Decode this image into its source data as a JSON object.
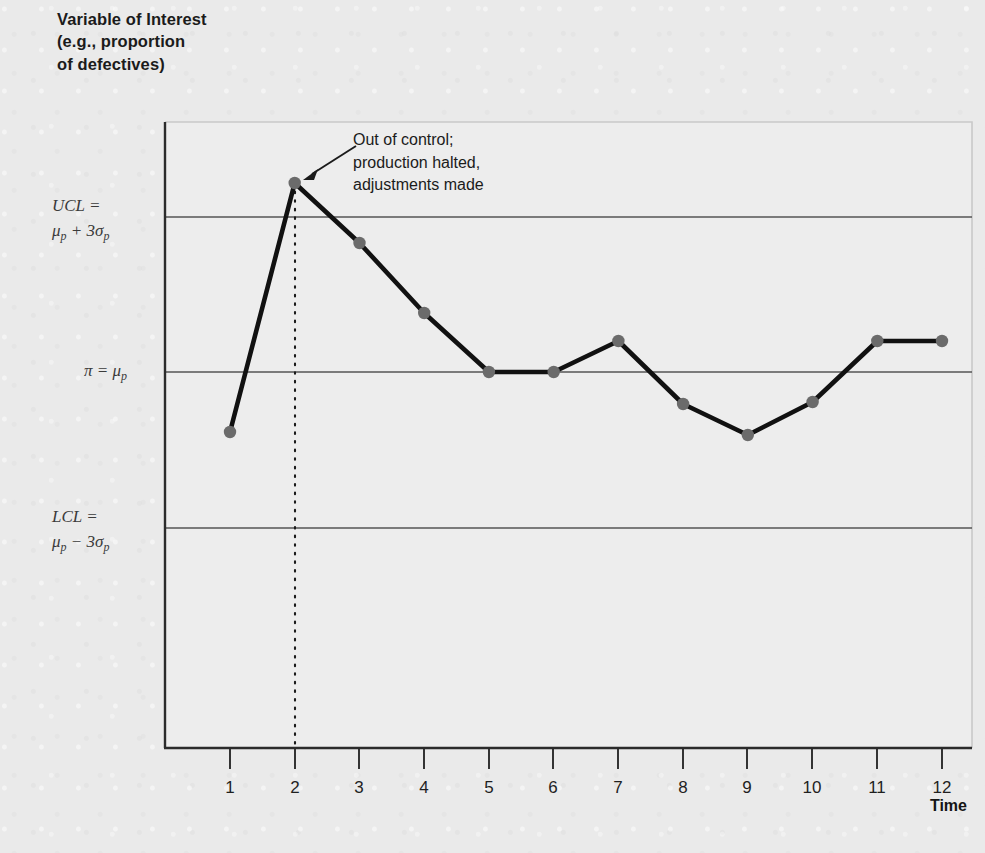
{
  "chart_title": "Variable of Interest\n(e.g., proportion\nof defectives)",
  "x_axis": {
    "title": "Time",
    "ticks": [
      "1",
      "2",
      "3",
      "4",
      "5",
      "6",
      "7",
      "8",
      "9",
      "10",
      "11",
      "12"
    ]
  },
  "limits": {
    "ucl_line1": "UCL =",
    "ucl_line2_mu": "μ",
    "ucl_line2_sub": "p",
    "ucl_line2_rest": " + 3σ",
    "ucl_line2_sub2": "p",
    "lcl_line1": "LCL =",
    "lcl_line2_mu": "μ",
    "lcl_line2_sub": "p",
    "lcl_line2_rest": " − 3σ",
    "lcl_line2_sub2": "p",
    "center_pi": "π = μ",
    "center_sub": "p",
    "ucl_text": "UCL = μp + 3σp",
    "lcl_text": "LCL = μp − 3σp",
    "center_text": "π = μp"
  },
  "annotation": {
    "text": "Out of control;\nproduction halted,\nadjustments made"
  },
  "colors": {
    "background": "#eaeaea",
    "plot_background": "#ededed",
    "series_line": "#111111",
    "marker": "#6b6b6b",
    "limit_line": "#555555",
    "axis": "#2b2b2b",
    "plot_border": "#c9c9c9",
    "text": "#1b1b1b"
  },
  "chart_data": {
    "type": "line",
    "title": "Variable of Interest (e.g., proportion of defectives)",
    "subtitle": "",
    "xlabel": "Time",
    "ylabel": "Variable of Interest (e.g., proportion of defectives)",
    "x": [
      1,
      2,
      3,
      4,
      5,
      6,
      7,
      8,
      9,
      10,
      11,
      12
    ],
    "tick_labels": [
      "1",
      "2",
      "3",
      "4",
      "5",
      "6",
      "7",
      "8",
      "9",
      "10",
      "11",
      "12"
    ],
    "series": [
      {
        "name": "Proportion of defectives",
        "values": [
          -0.386,
          1.218,
          0.832,
          0.445,
          0.0,
          0.0,
          0.2,
          -0.206,
          -0.406,
          -0.194,
          0.2,
          0.2
        ],
        "pixel_y": [
          432,
          183,
          243,
          313,
          372,
          372,
          341,
          404,
          435,
          402,
          341,
          341
        ],
        "marker": "circle",
        "marker_color": "#6b6b6b",
        "line_color": "#111111"
      }
    ],
    "reference_lines": [
      {
        "name": "UCL",
        "label": "UCL = μp + 3σp",
        "value": 1.0,
        "pixel_y": 217
      },
      {
        "name": "center",
        "label": "π = μp",
        "value": 0.0,
        "pixel_y": 372
      },
      {
        "name": "LCL",
        "label": "LCL = μp − 3σp",
        "value": -1.0,
        "pixel_y": 528
      }
    ],
    "annotations": [
      {
        "text": "Out of control; production halted, adjustments made",
        "points_to_x": 2,
        "type": "arrow"
      },
      {
        "text": "",
        "at_x": 2,
        "type": "vertical-dotted-line"
      }
    ],
    "ylim": [
      -2.38,
      1.48
    ],
    "xlim": [
      0,
      13
    ],
    "grid": false,
    "legend": "none",
    "y_ticks_shown": false
  }
}
